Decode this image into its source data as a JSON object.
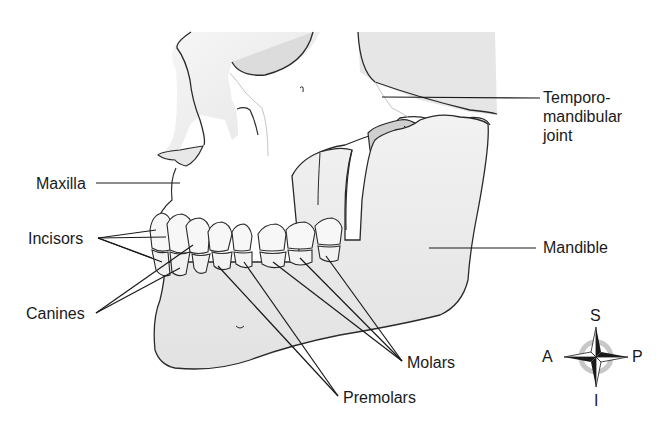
{
  "diagram": {
    "labels": {
      "tmj": [
        "Temporo-",
        "mandibular",
        "joint"
      ],
      "maxilla": "Maxilla",
      "incisors": "Incisors",
      "canines": "Canines",
      "mandible": "Mandible",
      "molars": "Molars",
      "premolars": "Premolars"
    },
    "compass": {
      "superior": "S",
      "inferior": "I",
      "anterior": "A",
      "posterior": "P"
    },
    "colors": {
      "bone_fill": "#efefef",
      "bone_shadow": "#d6d6d6",
      "dark_recess": "#c4c4c4",
      "outline": "#2a2a2a",
      "tooth_fill": "#f7f7f7",
      "leader_line": "#1a1a1a",
      "compass_ring": "#bdbdbd"
    }
  }
}
